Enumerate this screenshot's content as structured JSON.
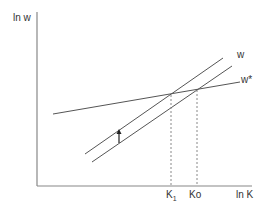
{
  "diagram": {
    "y_axis_label": "ln w",
    "x_axis_label": "ln K",
    "curves": [
      {
        "name": "w",
        "label": "w",
        "description": "upward-sloping line (shifted)"
      },
      {
        "name": "w-original",
        "label": "",
        "description": "upward-sloping line (lower)"
      },
      {
        "name": "w-star",
        "label": "w*",
        "description": "flatter upward-sloping line"
      }
    ],
    "x_ticks": [
      {
        "label": "K",
        "sub": "1"
      },
      {
        "label": "Ko",
        "sub": ""
      }
    ],
    "shift_arrow": "up",
    "colors": {
      "line": "#555555",
      "axis": "#777777",
      "dashed": "#888888",
      "text": "#333333"
    }
  }
}
